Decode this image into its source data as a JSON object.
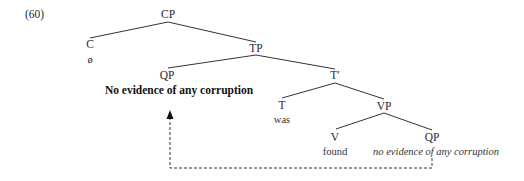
{
  "example_number": "(60)",
  "tree": {
    "cp": {
      "label": "CP"
    },
    "c": {
      "label": "C",
      "word": "ø"
    },
    "tp": {
      "label": "TP"
    },
    "qp_spec": {
      "label": "QP",
      "word": "No evidence of any corruption"
    },
    "t_bar": {
      "label": "T′"
    },
    "t": {
      "label": "T",
      "word": "was"
    },
    "vp": {
      "label": "VP"
    },
    "v": {
      "label": "V",
      "word": "found"
    },
    "qp_comp": {
      "label": "QP",
      "word": "no evidence of any corruption"
    }
  },
  "movement": {
    "from": "qp_comp",
    "to": "qp_spec",
    "style": "dashed-arrow"
  },
  "colors": {
    "line": "#333333",
    "text": "#2a2a2a"
  }
}
